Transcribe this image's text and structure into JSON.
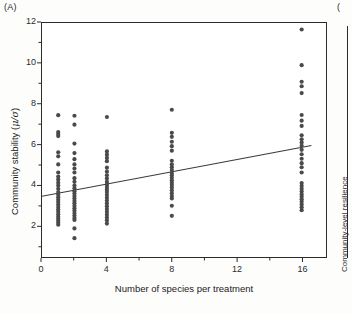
{
  "figure": {
    "panel_a_label": "(A)",
    "panel_b_label": "(",
    "panel_b_ylabel": "Community-level resilience"
  },
  "chart_data": {
    "type": "scatter",
    "title": "",
    "panel": "(A)",
    "xlabel": "Number of species per treatment",
    "ylabel": "Community stability (μ/σ)",
    "ylabel_text": "Community stability (",
    "ylabel_symbol": "μ/σ",
    "ylabel_tail": ")",
    "xlim": [
      0,
      17.5
    ],
    "ylim": [
      0.45,
      12
    ],
    "grid": false,
    "legend": null,
    "xticks": [
      0,
      4,
      8,
      12,
      16
    ],
    "xtick_labels": [
      "0",
      "4",
      "8",
      "12",
      "16"
    ],
    "xminorticks": [
      2,
      6,
      10,
      14
    ],
    "yticks": [
      2,
      4,
      6,
      8,
      10,
      12
    ],
    "ytick_labels": [
      "2",
      "4",
      "6",
      "8",
      "10",
      "12"
    ],
    "yminorticks": [
      1,
      3,
      5,
      7,
      9,
      11
    ],
    "marker": {
      "shape": "circle",
      "color": "#4a4a4a",
      "size_px": 4.2,
      "filled": true
    },
    "trendline": {
      "type": "linear-fit",
      "color": "#3a3a3a",
      "width_px": 1.1,
      "x_start": 0,
      "y_start": 3.45,
      "x_end": 16.6,
      "y_end": 5.95,
      "slope": 0.1506,
      "intercept": 3.45
    },
    "series": [
      {
        "name": "Community stability",
        "color": "#4a4a4a",
        "points": [
          {
            "x": 1,
            "y": 7.45
          },
          {
            "x": 1,
            "y": 6.62
          },
          {
            "x": 1,
            "y": 6.52
          },
          {
            "x": 1,
            "y": 6.42
          },
          {
            "x": 1,
            "y": 5.62
          },
          {
            "x": 1,
            "y": 5.42
          },
          {
            "x": 1,
            "y": 5.02
          },
          {
            "x": 1,
            "y": 4.62
          },
          {
            "x": 1,
            "y": 4.42
          },
          {
            "x": 1,
            "y": 4.28
          },
          {
            "x": 1,
            "y": 4.12
          },
          {
            "x": 1,
            "y": 3.98
          },
          {
            "x": 1,
            "y": 3.82
          },
          {
            "x": 1,
            "y": 3.66
          },
          {
            "x": 1,
            "y": 3.52
          },
          {
            "x": 1,
            "y": 3.4
          },
          {
            "x": 1,
            "y": 3.28
          },
          {
            "x": 1,
            "y": 3.16
          },
          {
            "x": 1,
            "y": 3.04
          },
          {
            "x": 1,
            "y": 2.92
          },
          {
            "x": 1,
            "y": 2.8
          },
          {
            "x": 1,
            "y": 2.68
          },
          {
            "x": 1,
            "y": 2.56
          },
          {
            "x": 1,
            "y": 2.44
          },
          {
            "x": 1,
            "y": 2.34
          },
          {
            "x": 1,
            "y": 2.24
          },
          {
            "x": 1,
            "y": 2.14
          },
          {
            "x": 1,
            "y": 2.04
          },
          {
            "x": 2,
            "y": 7.42
          },
          {
            "x": 2,
            "y": 6.98
          },
          {
            "x": 2,
            "y": 6.05
          },
          {
            "x": 2,
            "y": 5.58
          },
          {
            "x": 2,
            "y": 5.28
          },
          {
            "x": 2,
            "y": 5.02
          },
          {
            "x": 2,
            "y": 4.82
          },
          {
            "x": 2,
            "y": 4.62
          },
          {
            "x": 2,
            "y": 4.34
          },
          {
            "x": 2,
            "y": 4.16
          },
          {
            "x": 2,
            "y": 3.98
          },
          {
            "x": 2,
            "y": 3.84
          },
          {
            "x": 2,
            "y": 3.7
          },
          {
            "x": 2,
            "y": 3.58
          },
          {
            "x": 2,
            "y": 3.46
          },
          {
            "x": 2,
            "y": 3.34
          },
          {
            "x": 2,
            "y": 3.22
          },
          {
            "x": 2,
            "y": 3.1
          },
          {
            "x": 2,
            "y": 2.98
          },
          {
            "x": 2,
            "y": 2.86
          },
          {
            "x": 2,
            "y": 2.74
          },
          {
            "x": 2,
            "y": 2.62
          },
          {
            "x": 2,
            "y": 2.5
          },
          {
            "x": 2,
            "y": 2.38
          },
          {
            "x": 2,
            "y": 2.28
          },
          {
            "x": 2,
            "y": 1.86
          },
          {
            "x": 2,
            "y": 1.38
          },
          {
            "x": 4,
            "y": 7.36
          },
          {
            "x": 4,
            "y": 5.66
          },
          {
            "x": 4,
            "y": 5.5
          },
          {
            "x": 4,
            "y": 5.34
          },
          {
            "x": 4,
            "y": 5.18
          },
          {
            "x": 4,
            "y": 4.86
          },
          {
            "x": 4,
            "y": 4.66
          },
          {
            "x": 4,
            "y": 4.48
          },
          {
            "x": 4,
            "y": 4.32
          },
          {
            "x": 4,
            "y": 4.16
          },
          {
            "x": 4,
            "y": 4.02
          },
          {
            "x": 4,
            "y": 3.9
          },
          {
            "x": 4,
            "y": 3.78
          },
          {
            "x": 4,
            "y": 3.66
          },
          {
            "x": 4,
            "y": 3.52
          },
          {
            "x": 4,
            "y": 3.38
          },
          {
            "x": 4,
            "y": 3.24
          },
          {
            "x": 4,
            "y": 3.1
          },
          {
            "x": 4,
            "y": 2.96
          },
          {
            "x": 4,
            "y": 2.82
          },
          {
            "x": 4,
            "y": 2.68
          },
          {
            "x": 4,
            "y": 2.54
          },
          {
            "x": 4,
            "y": 2.4
          },
          {
            "x": 4,
            "y": 2.26
          },
          {
            "x": 4,
            "y": 2.1
          },
          {
            "x": 8,
            "y": 7.72
          },
          {
            "x": 8,
            "y": 6.58
          },
          {
            "x": 8,
            "y": 6.38
          },
          {
            "x": 8,
            "y": 6.14
          },
          {
            "x": 8,
            "y": 5.92
          },
          {
            "x": 8,
            "y": 5.7
          },
          {
            "x": 8,
            "y": 5.2
          },
          {
            "x": 8,
            "y": 5.02
          },
          {
            "x": 8,
            "y": 4.88
          },
          {
            "x": 8,
            "y": 4.74
          },
          {
            "x": 8,
            "y": 4.6
          },
          {
            "x": 8,
            "y": 4.48
          },
          {
            "x": 8,
            "y": 4.36
          },
          {
            "x": 8,
            "y": 4.24
          },
          {
            "x": 8,
            "y": 4.12
          },
          {
            "x": 8,
            "y": 4.0
          },
          {
            "x": 8,
            "y": 3.88
          },
          {
            "x": 8,
            "y": 3.74
          },
          {
            "x": 8,
            "y": 3.6
          },
          {
            "x": 8,
            "y": 3.46
          },
          {
            "x": 8,
            "y": 3.34
          },
          {
            "x": 8,
            "y": 2.98
          },
          {
            "x": 8,
            "y": 2.48
          },
          {
            "x": 16,
            "y": 11.68
          },
          {
            "x": 16,
            "y": 9.92
          },
          {
            "x": 16,
            "y": 9.1
          },
          {
            "x": 16,
            "y": 8.88
          },
          {
            "x": 16,
            "y": 8.54
          },
          {
            "x": 16,
            "y": 7.46
          },
          {
            "x": 16,
            "y": 7.18
          },
          {
            "x": 16,
            "y": 6.92
          },
          {
            "x": 16,
            "y": 6.46
          },
          {
            "x": 16,
            "y": 6.26
          },
          {
            "x": 16,
            "y": 6.1
          },
          {
            "x": 16,
            "y": 5.94
          },
          {
            "x": 16,
            "y": 5.74
          },
          {
            "x": 16,
            "y": 5.52
          },
          {
            "x": 16,
            "y": 5.3
          },
          {
            "x": 16,
            "y": 5.08
          },
          {
            "x": 16,
            "y": 4.88
          },
          {
            "x": 16,
            "y": 4.62
          },
          {
            "x": 16,
            "y": 4.1
          },
          {
            "x": 16,
            "y": 3.96
          },
          {
            "x": 16,
            "y": 3.82
          },
          {
            "x": 16,
            "y": 3.68
          },
          {
            "x": 16,
            "y": 3.54
          },
          {
            "x": 16,
            "y": 3.42
          },
          {
            "x": 16,
            "y": 3.3
          },
          {
            "x": 16,
            "y": 3.18
          },
          {
            "x": 16,
            "y": 3.04
          },
          {
            "x": 16,
            "y": 2.9
          },
          {
            "x": 16,
            "y": 2.76
          }
        ]
      }
    ]
  }
}
